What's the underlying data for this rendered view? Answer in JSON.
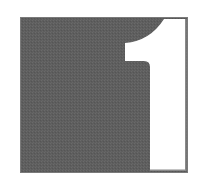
{
  "icon": {
    "name": "number-one-tile-icon",
    "glyph": "1",
    "colors": {
      "tile": "#5e5e5e",
      "border": "#7a7a7a",
      "glyph": "#ffffff",
      "background": "#ffffff"
    }
  }
}
